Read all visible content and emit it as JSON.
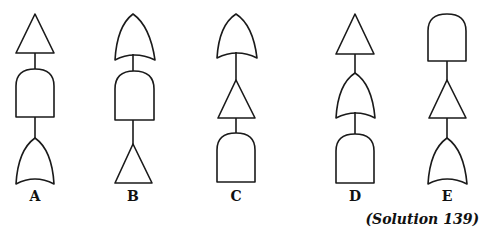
{
  "figure": {
    "caption": "(Solution 139)",
    "stroke_color": "#1a1a1a",
    "background_color": "#ffffff",
    "columns": [
      {
        "label": "A",
        "center_x": 35,
        "stack_top_to_bottom": [
          "triangle",
          "and-gate",
          "or-gate"
        ]
      },
      {
        "label": "B",
        "center_x": 133,
        "stack_top_to_bottom": [
          "or-gate",
          "and-gate",
          "triangle"
        ]
      },
      {
        "label": "C",
        "center_x": 236,
        "stack_top_to_bottom": [
          "or-gate",
          "triangle",
          "and-gate"
        ]
      },
      {
        "label": "D",
        "center_x": 355,
        "stack_top_to_bottom": [
          "triangle",
          "or-gate",
          "and-gate"
        ]
      },
      {
        "label": "E",
        "center_x": 447,
        "stack_top_to_bottom": [
          "and-gate",
          "triangle",
          "or-gate"
        ]
      }
    ]
  }
}
